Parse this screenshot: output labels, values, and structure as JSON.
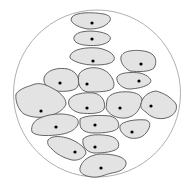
{
  "diagram": {
    "type": "cell-cluster-in-circle",
    "colors": {
      "background": "#ffffff",
      "boundary_stroke": "#b0b0b0",
      "cell_fill": "#e3e3e3",
      "cell_stroke": "#555555",
      "nucleus_fill": "#000000"
    },
    "boundary": {
      "cx": 97,
      "cy": 93.5,
      "r": 83.5
    },
    "cells": [
      {
        "id": 1,
        "path": "M72,17 C76,12 92,12 104,14 C112,16 112,20 107,24 C102,28 96,29 88,29 C80,28 72,24 71,20 Z",
        "nucleus": [
          92,
          23
        ]
      },
      {
        "id": 2,
        "path": "M74,37 C76,31 90,30 100,32 C110,34 113,38 108,42 C102,46 92,46 84,45 C77,44 73,41 74,37 Z",
        "nucleus": [
          92,
          39
        ]
      },
      {
        "id": 3,
        "path": "M70,56 C72,49 86,47 98,48 C110,50 116,56 114,60 C112,64 104,65 94,65 C84,65 74,62 70,58 Z",
        "nucleus": [
          93,
          61
        ]
      },
      {
        "id": 4,
        "path": "M121,57 C122,50 138,49 148,52 C157,55 157,63 154,68 C150,72 138,72 130,71 C124,68 120,62 121,57 Z",
        "nucleus": [
          141,
          64
        ]
      },
      {
        "id": 5,
        "path": "M44,78 C46,70 58,67 68,69 C78,72 80,80 78,86 C76,91 66,92 56,91 C48,89 43,84 44,78 Z",
        "nucleus": [
          60,
          83
        ]
      },
      {
        "id": 6,
        "path": "M79,74 C84,67 96,66 104,70 C112,74 116,84 113,88 C110,92 98,92 88,92 C80,91 77,84 79,74 Z",
        "nucleus": [
          87,
          84
        ]
      },
      {
        "id": 7,
        "path": "M117,77 C120,72 132,72 140,73 C148,75 153,80 150,83 C146,87 136,89 128,89 C120,87 116,82 117,77 Z",
        "nucleus": [
          139,
          81
        ]
      },
      {
        "id": 8,
        "path": "M16,94 C20,88 30,86 35,84 C40,83 45,84 52,88 C60,92 66,98 66,104 C64,110 56,114 50,116 C42,118 32,118 24,114 C18,110 15,100 16,94 Z",
        "nucleus": [
          41,
          111
        ]
      },
      {
        "id": 9,
        "path": "M69,100 C72,94 84,92 94,93 C103,95 106,103 104,109 C101,114 90,114 80,113 C72,111 67,106 69,100 Z",
        "nucleus": [
          87,
          108
        ]
      },
      {
        "id": 10,
        "path": "M107,100 C109,93 120,91 130,92 C140,93 144,98 141,104 C139,110 136,116 126,118 C116,119 108,114 106,108 Z",
        "nucleus": [
          120,
          108
        ]
      },
      {
        "id": 11,
        "path": "M141,104 C142,97 148,92 156,91 C164,93 172,98 176,104 C178,110 174,116 166,118 C158,120 150,117 146,112 C142,110 140,107 141,104 Z",
        "nucleus": [
          151,
          106
        ]
      },
      {
        "id": 12,
        "path": "M33,124 C36,118 48,114 60,114 C72,114 80,118 78,124 C76,130 68,134 56,135 C46,136 36,136 32,132 C31,129 32,126 33,124 Z",
        "nucleus": [
          56,
          127
        ]
      },
      {
        "id": 13,
        "path": "M80,119 C86,115 100,115 110,116 C118,118 120,124 118,128 C115,132 104,133 94,133 C86,133 80,130 80,124 Z",
        "nucleus": [
          95,
          125
        ]
      },
      {
        "id": 14,
        "path": "M120,126 C122,121 136,119 146,120 C152,122 150,128 146,133 C142,138 136,139 130,138 C124,136 119,131 120,126 Z",
        "nucleus": [
          132,
          132
        ]
      },
      {
        "id": 15,
        "path": "M48,140 C52,135 62,136 70,139 C78,142 86,148 86,153 C84,158 78,161 72,160 C64,158 56,154 52,149 C48,146 47,143 48,140 Z",
        "nucleus": [
          75,
          152
        ]
      },
      {
        "id": 16,
        "path": "M83,139 C88,134 100,134 110,136 C118,138 120,144 118,148 C114,152 104,153 94,153 C86,152 82,146 83,139 Z",
        "nucleus": [
          95,
          147
        ]
      },
      {
        "id": 17,
        "path": "M80,168 C82,160 90,155 100,154 C112,154 124,156 126,162 C127,168 120,172 112,173 C106,174 100,178 92,177 C84,176 79,173 80,168 Z",
        "nucleus": [
          101,
          168
        ]
      }
    ]
  }
}
